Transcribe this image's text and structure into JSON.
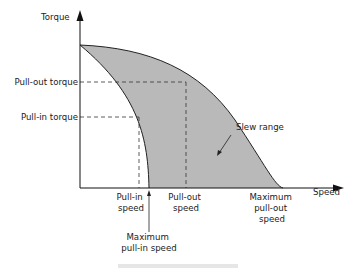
{
  "diagram": {
    "type": "stepper-motor torque-speed curve",
    "y_axis_label": "Torque",
    "x_axis_label": "Speed",
    "y_ticks": {
      "pull_out_torque": "Pull-out torque",
      "pull_in_torque": "Pull-in torque"
    },
    "x_ticks": {
      "pull_in_speed": [
        "Pull-in",
        "speed"
      ],
      "pull_out_speed": [
        "Pull-out",
        "speed"
      ],
      "max_pull_out_speed": [
        "Maximum",
        "pull-out",
        "speed"
      ],
      "max_pull_in_speed": [
        "Maximum",
        "pull-in speed"
      ]
    },
    "region_label": "Slew range",
    "colors": {
      "shade": "#b9b9b9",
      "line": "#222222"
    }
  }
}
